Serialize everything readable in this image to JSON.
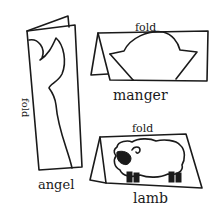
{
  "diagram": {
    "background": "#ffffff",
    "ink_color": "#1a1a1a",
    "items": [
      {
        "name": "angel",
        "label": "angel",
        "fold_label": "fold",
        "fold_orientation": "vertical"
      },
      {
        "name": "manger",
        "label": "manger",
        "fold_label": "fold",
        "fold_orientation": "horizontal"
      },
      {
        "name": "lamb",
        "label": "lamb",
        "fold_label": "fold",
        "fold_orientation": "horizontal"
      }
    ]
  }
}
